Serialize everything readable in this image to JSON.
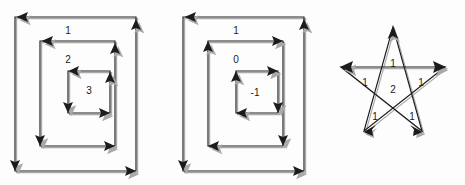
{
  "figure": {
    "background_color": "#fdfdfd",
    "line_color": "#1c1c1c",
    "shadow_color": "#a9a9a9",
    "label_color": "#1a1a1a",
    "panels": [
      {
        "name": "nested-squares-counterclockwise",
        "shape": "square-spiral",
        "orientation": "counterclockwise",
        "labels": [
          {
            "text": "1",
            "x": 68,
            "y": 29
          },
          {
            "text": "2",
            "x": 68,
            "y": 59
          },
          {
            "text": "3",
            "x": 89,
            "y": 90
          }
        ],
        "loops": [
          {
            "label": "1",
            "winding": 1
          },
          {
            "label": "2",
            "winding": 2
          },
          {
            "label": "3",
            "winding": 3
          }
        ]
      },
      {
        "name": "nested-squares-mixed",
        "shape": "square-spiral",
        "orientation": "mixed",
        "labels": [
          {
            "text": "1",
            "x": 236,
            "y": 29
          },
          {
            "text": "0",
            "x": 236,
            "y": 59
          },
          {
            "text": "-1",
            "x": 254,
            "y": 92
          }
        ],
        "loops": [
          {
            "label": "1",
            "winding": 1
          },
          {
            "label": "0",
            "winding": 0
          },
          {
            "label": "-1",
            "winding": -1
          }
        ]
      },
      {
        "name": "pentagram-star",
        "shape": "pentagram",
        "orientation": "single-stroke",
        "labels": [
          {
            "text": "1",
            "x": 393,
            "y": 63
          },
          {
            "text": "1",
            "x": 366,
            "y": 82
          },
          {
            "text": "1",
            "x": 420,
            "y": 82
          },
          {
            "text": "2",
            "x": 393,
            "y": 89
          },
          {
            "text": "1",
            "x": 375,
            "y": 116
          },
          {
            "text": "1",
            "x": 412,
            "y": 116
          }
        ],
        "regions": [
          {
            "label": "1",
            "winding": 1
          },
          {
            "label": "1",
            "winding": 1
          },
          {
            "label": "1",
            "winding": 1
          },
          {
            "label": "2",
            "winding": 2
          },
          {
            "label": "1",
            "winding": 1
          },
          {
            "label": "1",
            "winding": 1
          }
        ]
      }
    ]
  }
}
